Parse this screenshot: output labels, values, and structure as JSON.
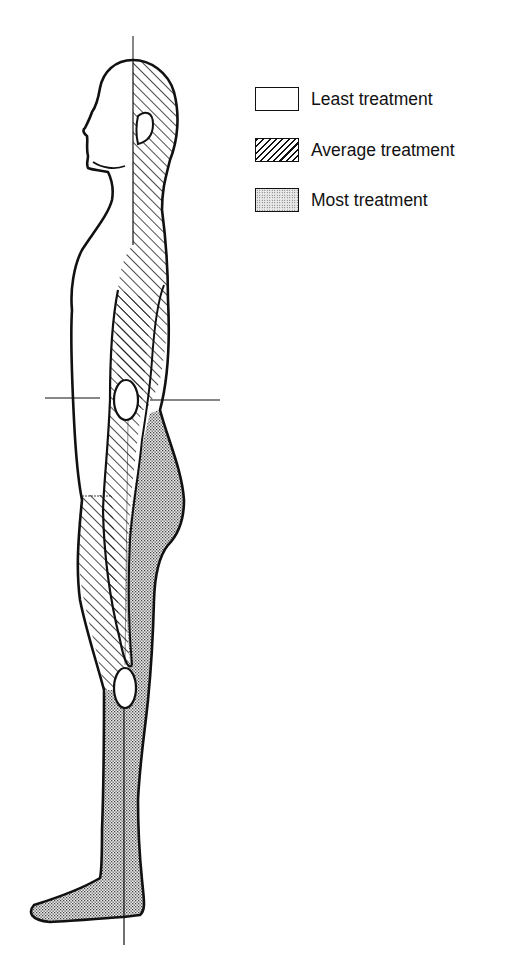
{
  "figure": {
    "regions": [
      {
        "name": "face-front-torso-front",
        "treatment": "least"
      },
      {
        "name": "back-of-head-back-arm",
        "treatment": "average"
      },
      {
        "name": "front-thigh",
        "treatment": "average"
      },
      {
        "name": "buttocks-back-thigh-lower-leg-foot",
        "treatment": "most"
      }
    ],
    "markers": [
      "hip-joint",
      "knee-joint"
    ],
    "reference_lines": [
      "vertical-midline",
      "horizontal-hip-line"
    ]
  },
  "legend": {
    "items": [
      {
        "label": "Least treatment",
        "pattern": "blank"
      },
      {
        "label": "Average treatment",
        "pattern": "hatched"
      },
      {
        "label": "Most treatment",
        "pattern": "dotted"
      }
    ]
  },
  "colors": {
    "ink": "#111111",
    "stipple_bg": "#e6e6e6",
    "background": "#ffffff"
  }
}
